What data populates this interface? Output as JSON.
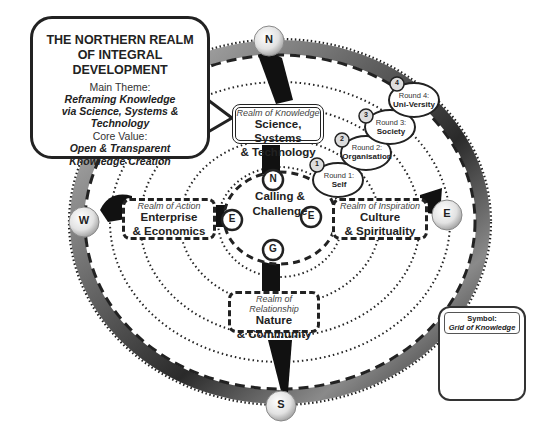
{
  "callout": {
    "title_line1": "THE NORTHERN REALM",
    "title_line2": "OF INTEGRAL DEVELOPMENT",
    "theme_label": "Main Theme:",
    "theme_line1": "Reframing Knowledge",
    "theme_line2": "via Science, Systems & Technology",
    "value_label": "Core Value:",
    "value_line1": "Open & Transparent",
    "value_line2": "Knowledge Creation"
  },
  "compass": {
    "north": "N",
    "east": "E",
    "south": "S",
    "west": "W"
  },
  "center": {
    "line1": "Calling &",
    "line2": "Challenge",
    "inner_markers": {
      "north": "N",
      "east": "E",
      "south": "G",
      "west": "E"
    }
  },
  "realms": {
    "north": {
      "kind": "Realm of Knowledge",
      "name_line1": "Science, Systems",
      "name_line2": "& Technology"
    },
    "east": {
      "kind": "Realm of Inspiration",
      "name_line1": "Culture",
      "name_line2": "& Spirituality"
    },
    "south": {
      "kind": "Realm of Relationship",
      "name_line1": "Nature",
      "name_line2": "& Community"
    },
    "west": {
      "kind": "Realm of Action",
      "name_line1": "Enterprise",
      "name_line2": "& Economics"
    }
  },
  "rounds": [
    {
      "number": "1",
      "label": "Round 1:",
      "name": "Self"
    },
    {
      "number": "2",
      "label": "Round 2:",
      "name": "Organisation"
    },
    {
      "number": "3",
      "label": "Round 3:",
      "name": "Society"
    },
    {
      "number": "4",
      "label": "Round 4:",
      "name": "Uni-Versity"
    }
  ],
  "symbol": {
    "label": "Symbol:",
    "name": "Grid of Knowledge"
  }
}
